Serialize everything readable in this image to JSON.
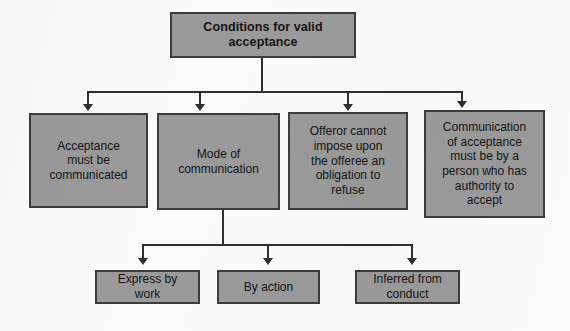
{
  "diagram": {
    "title_box": {
      "id": "conditions-for-valid-acceptance",
      "label": "Conditions for valid\nacceptance"
    },
    "level2": [
      {
        "id": "acceptance-must-be-communicated",
        "label": "Acceptance\nmust be\ncommunicated"
      },
      {
        "id": "mode-of-communication",
        "label": "Mode of\ncommunication"
      },
      {
        "id": "offeror-cannot-impose",
        "label": "Offeror cannot\nimpose upon\nthe offeree an\nobligation to\nrefuse"
      },
      {
        "id": "communication-by-authorised-person",
        "label": "Communication\nof acceptance\nmust be by a\nperson who has\nauthority to\naccept"
      }
    ],
    "level3": [
      {
        "id": "express-by-work",
        "label": "Express by\nwork"
      },
      {
        "id": "by-action",
        "label": "By action"
      },
      {
        "id": "inferred-from-conduct",
        "label": "Inferred from\nconduct"
      }
    ],
    "colors": {
      "node_fill": "#9a9a9a",
      "node_border": "#3c3c3c",
      "connector": "#2e2e2e",
      "text": "#141414",
      "background": "#fbfbfb"
    }
  }
}
